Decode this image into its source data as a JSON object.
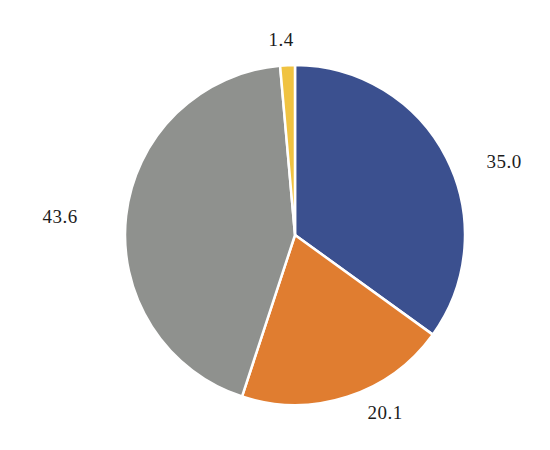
{
  "chart_data": {
    "type": "pie",
    "title": "",
    "values": [
      35.0,
      20.1,
      43.6,
      1.4
    ],
    "labels": [
      "35.0",
      "20.1",
      "43.6",
      "1.4"
    ],
    "colors": [
      "#3b508f",
      "#e07d30",
      "#8f918e",
      "#f0c342"
    ],
    "slice_names": [
      "blue",
      "orange",
      "gray",
      "yellow"
    ],
    "start_angle": "12-oclock",
    "direction": "clockwise",
    "slice_gap_color": "#ffffff",
    "labels_outside": true,
    "legend_position": "none",
    "background_color": "#ffffff"
  }
}
